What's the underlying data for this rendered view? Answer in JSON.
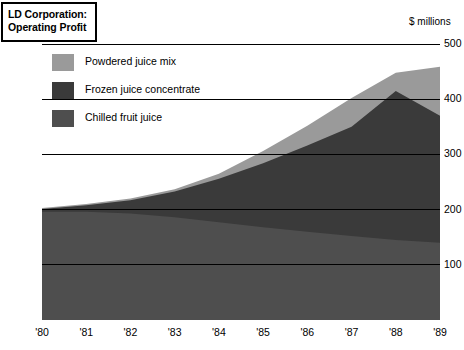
{
  "title": {
    "line1": "LD Corporation:",
    "line2": "Operating Profit"
  },
  "units_label": "$ millions",
  "colors": {
    "powdered": "#9a9a9a",
    "frozen": "#3a3a3a",
    "chilled": "#4e4e4e",
    "gridline": "#000000",
    "background": "#ffffff"
  },
  "legend": {
    "items": [
      {
        "label": "Powdered juice mix",
        "color": "#9a9a9a"
      },
      {
        "label": "Frozen juice concentrate",
        "color": "#3a3a3a"
      },
      {
        "label": "Chilled fruit juice",
        "color": "#4e4e4e"
      }
    ]
  },
  "chart_data": {
    "type": "area",
    "stacked": true,
    "title": "LD Corporation: Operating Profit",
    "xlabel": "",
    "ylabel": "$ millions",
    "ylim": [
      0,
      500
    ],
    "yticks": [
      100,
      200,
      300,
      400,
      500
    ],
    "ytick_labels": [
      "100",
      "200",
      "300",
      "400",
      "500"
    ],
    "grid": true,
    "legend_position": "upper-left",
    "x": [
      "1980",
      "1981",
      "1982",
      "1983",
      "1984",
      "1985",
      "1986",
      "1987",
      "1988",
      "1989"
    ],
    "categories": [
      "'80",
      "'81",
      "'82",
      "'83",
      "'84",
      "'85",
      "'86",
      "'87",
      "'88",
      "'89"
    ],
    "series": [
      {
        "name": "Chilled fruit juice",
        "color": "#4e4e4e",
        "values": [
          196,
          196,
          193,
          186,
          177,
          168,
          160,
          152,
          145,
          140
        ]
      },
      {
        "name": "Frozen juice concentrate",
        "color": "#3a3a3a",
        "values": [
          5,
          12,
          24,
          47,
          79,
          116,
          156,
          198,
          270,
          230
        ]
      },
      {
        "name": "Powdered juice mix",
        "color": "#9a9a9a",
        "values": [
          2,
          2,
          3,
          4,
          9,
          22,
          36,
          52,
          33,
          89
        ]
      }
    ],
    "cumulative_totals": [
      203,
      210,
      220,
      237,
      265,
      306,
      352,
      402,
      448,
      459
    ]
  }
}
